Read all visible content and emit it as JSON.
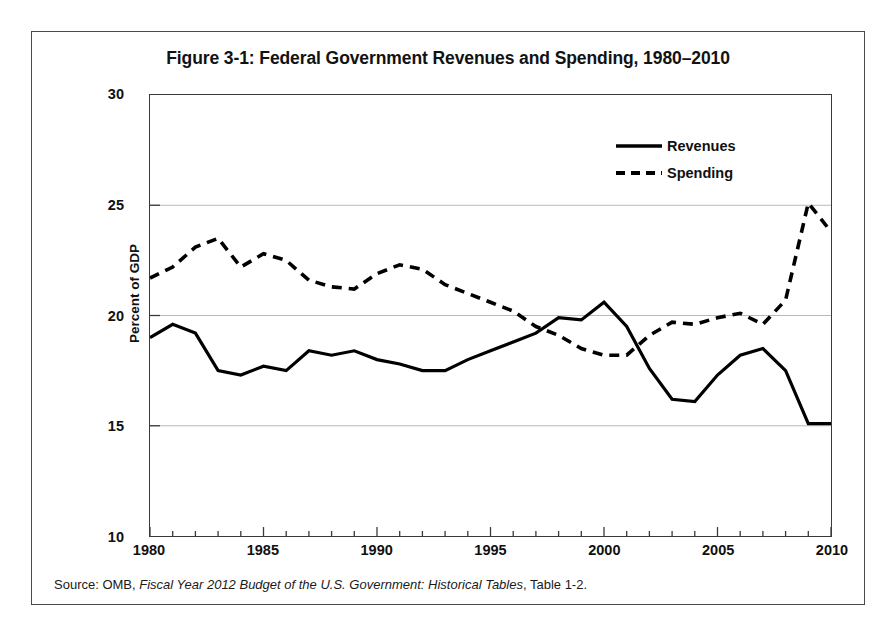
{
  "figure": {
    "title": "Figure 3-1: Federal Government Revenues and Spending, 1980–2010",
    "source_prefix": "Source: OMB, ",
    "source_italic": "Fiscal Year 2012 Budget of the U.S. Government: Historical Tables",
    "source_suffix": ", Table 1-2."
  },
  "legend": {
    "entries": [
      {
        "label": "Revenues",
        "style": "solid",
        "color": "#000000"
      },
      {
        "label": "Spending",
        "style": "dashed",
        "color": "#000000"
      }
    ]
  },
  "axes": {
    "ylabel": "Percent of GDP",
    "yticks": [
      "30",
      "25",
      "20",
      "15",
      "10"
    ],
    "xticks": [
      "1980",
      "1985",
      "1990",
      "1995",
      "2000",
      "2005",
      "2010"
    ]
  },
  "chart_data": {
    "type": "line",
    "title": "Figure 3-1: Federal Government Revenues and Spending, 1980–2010",
    "xlabel": "",
    "ylabel": "Percent of GDP",
    "xlim": [
      1980,
      2010
    ],
    "ylim": [
      10,
      30
    ],
    "ytick_values": [
      10,
      15,
      20,
      25,
      30
    ],
    "xtick_values": [
      1980,
      1985,
      1990,
      1995,
      2000,
      2005,
      2010
    ],
    "grid": "horizontal-major",
    "legend_position": "top-right",
    "x": [
      1980,
      1981,
      1982,
      1983,
      1984,
      1985,
      1986,
      1987,
      1988,
      1989,
      1990,
      1991,
      1992,
      1993,
      1994,
      1995,
      1996,
      1997,
      1998,
      1999,
      2000,
      2001,
      2002,
      2003,
      2004,
      2005,
      2006,
      2007,
      2008,
      2009,
      2010
    ],
    "series": [
      {
        "name": "Revenues",
        "style": "solid",
        "color": "#000000",
        "values": [
          19.0,
          19.6,
          19.2,
          17.5,
          17.3,
          17.7,
          17.5,
          18.4,
          18.2,
          18.4,
          18.0,
          17.8,
          17.5,
          17.5,
          18.0,
          18.4,
          18.8,
          19.2,
          19.9,
          19.8,
          20.6,
          19.5,
          17.6,
          16.2,
          16.1,
          17.3,
          18.2,
          18.5,
          17.5,
          15.1,
          15.1
        ]
      },
      {
        "name": "Spending",
        "style": "dashed",
        "color": "#000000",
        "values": [
          21.7,
          22.2,
          23.1,
          23.5,
          22.2,
          22.8,
          22.5,
          21.6,
          21.3,
          21.2,
          21.9,
          22.3,
          22.1,
          21.4,
          21.0,
          20.6,
          20.2,
          19.5,
          19.1,
          18.5,
          18.2,
          18.2,
          19.1,
          19.7,
          19.6,
          19.9,
          20.1,
          19.6,
          20.7,
          25.1,
          23.8
        ]
      }
    ]
  }
}
